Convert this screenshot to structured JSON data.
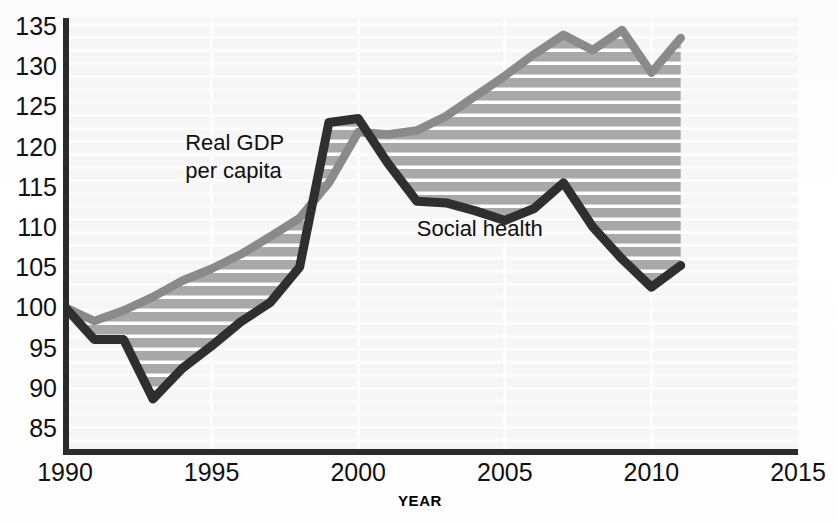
{
  "chart_data": {
    "type": "line",
    "title": "",
    "xlabel": "YEAR",
    "ylabel": "",
    "xlim": [
      1990,
      2015
    ],
    "ylim": [
      82,
      136
    ],
    "xticks": [
      "1990",
      "1995",
      "2000",
      "2005",
      "2010",
      "2015"
    ],
    "xtick_values": [
      1990,
      1995,
      2000,
      2005,
      2010,
      2015
    ],
    "yticks": [
      "85",
      "90",
      "95",
      "100",
      "105",
      "110",
      "115",
      "120",
      "125",
      "130",
      "135"
    ],
    "ytick_values": [
      85,
      90,
      95,
      100,
      105,
      110,
      115,
      120,
      125,
      130,
      135
    ],
    "grid": "horizontal-striped-band-fill",
    "legend": "inline-labels",
    "x": [
      1990,
      1991,
      1992,
      1993,
      1994,
      1995,
      1996,
      1997,
      1998,
      1999,
      2000,
      2001,
      2002,
      2003,
      2004,
      2005,
      2006,
      2007,
      2008,
      2009,
      2010,
      2011
    ],
    "series": [
      {
        "name": "Real GDP per capita",
        "color": "#8a8a8a",
        "label_text": "Real GDP\nper capita",
        "values": [
          100.0,
          98.3,
          99.6,
          101.3,
          103.3,
          104.8,
          106.6,
          108.8,
          111.1,
          115.5,
          121.8,
          121.5,
          122.0,
          123.8,
          126.3,
          128.8,
          131.5,
          133.9,
          132.0,
          134.5,
          129.2,
          133.5
        ]
      },
      {
        "name": "Social health",
        "color": "#2f2f2f",
        "label_text": "Social health",
        "values": [
          100.0,
          96.0,
          96.0,
          88.6,
          92.4,
          95.2,
          98.2,
          100.6,
          105.0,
          123.0,
          123.5,
          118.0,
          113.2,
          113.0,
          112.0,
          110.8,
          112.3,
          115.5,
          110.0,
          106.0,
          102.5,
          105.2
        ]
      }
    ],
    "annotations": [
      {
        "name": "gdp-series-label",
        "line1": "Real GDP",
        "line2": "per capita",
        "x": 1994.1,
        "y": 119.6
      },
      {
        "name": "social-health-series-label",
        "line1": "Social health",
        "line2": "",
        "x": 2002.0,
        "y": 108.9
      }
    ],
    "band": {
      "name": "gap-between-series",
      "fill_description": "horizontal gray stripes with white separators",
      "stripe_color": "#a6a6a6",
      "separator_color": "#ffffff"
    }
  },
  "axis": {
    "year_label": "YEAR",
    "axis_color": "#2b2b2b"
  }
}
